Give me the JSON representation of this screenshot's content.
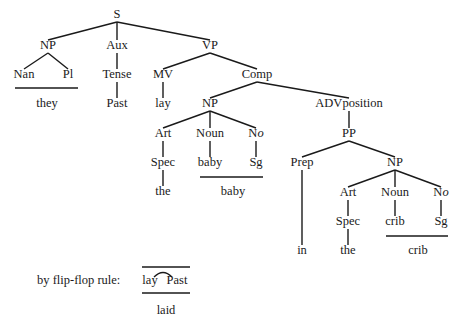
{
  "tree": {
    "nodes": [
      {
        "id": "S",
        "label": "S",
        "x": 117,
        "y": 18
      },
      {
        "id": "NP1",
        "label": "NP",
        "x": 48,
        "y": 49
      },
      {
        "id": "Aux",
        "label": "Aux",
        "x": 117,
        "y": 49
      },
      {
        "id": "VP",
        "label": "VP",
        "x": 210,
        "y": 49
      },
      {
        "id": "Nan",
        "label": "Nan",
        "x": 24,
        "y": 78
      },
      {
        "id": "Pl",
        "label": "Pl",
        "x": 68,
        "y": 78
      },
      {
        "id": "Tense",
        "label": "Tense",
        "x": 117,
        "y": 78
      },
      {
        "id": "MV",
        "label": "MV",
        "x": 163,
        "y": 78
      },
      {
        "id": "Comp",
        "label": "Comp",
        "x": 257,
        "y": 78
      },
      {
        "id": "they",
        "label": "they",
        "x": 47,
        "y": 107
      },
      {
        "id": "Past",
        "label": "Past",
        "x": 117,
        "y": 107
      },
      {
        "id": "lay",
        "label": "lay",
        "x": 163,
        "y": 107
      },
      {
        "id": "NP2",
        "label": "NP",
        "x": 210,
        "y": 107
      },
      {
        "id": "ADVposition",
        "label": "ADVposition",
        "x": 349,
        "y": 107
      },
      {
        "id": "Art1",
        "label": "Art",
        "x": 163,
        "y": 137
      },
      {
        "id": "Noun1",
        "label": "Noun",
        "x": 210,
        "y": 137
      },
      {
        "id": "No1",
        "label": "No",
        "x": 256,
        "y": 137,
        "italic_o": true
      },
      {
        "id": "PP",
        "label": "PP",
        "x": 349,
        "y": 137
      },
      {
        "id": "Spec1",
        "label": "Spec",
        "x": 163,
        "y": 166
      },
      {
        "id": "baby1",
        "label": "baby",
        "x": 210,
        "y": 166
      },
      {
        "id": "Sg1",
        "label": "Sg",
        "x": 256,
        "y": 166
      },
      {
        "id": "Prep",
        "label": "Prep",
        "x": 302,
        "y": 166
      },
      {
        "id": "NP3",
        "label": "NP",
        "x": 395,
        "y": 166
      },
      {
        "id": "the1",
        "label": "the",
        "x": 163,
        "y": 195
      },
      {
        "id": "baby2",
        "label": "baby",
        "x": 233,
        "y": 195
      },
      {
        "id": "Art2",
        "label": "Art",
        "x": 348,
        "y": 196
      },
      {
        "id": "Noun2",
        "label": "Noun",
        "x": 395,
        "y": 196
      },
      {
        "id": "No2",
        "label": "No",
        "x": 441,
        "y": 196,
        "italic_o": true
      },
      {
        "id": "Spec2",
        "label": "Spec",
        "x": 348,
        "y": 225
      },
      {
        "id": "crib1",
        "label": "crib",
        "x": 395,
        "y": 225
      },
      {
        "id": "Sg2",
        "label": "Sg",
        "x": 441,
        "y": 225
      },
      {
        "id": "in",
        "label": "in",
        "x": 302,
        "y": 254
      },
      {
        "id": "the2",
        "label": "the",
        "x": 348,
        "y": 254
      },
      {
        "id": "crib2",
        "label": "crib",
        "x": 418,
        "y": 254
      }
    ],
    "edges": [
      [
        117,
        22,
        48,
        40
      ],
      [
        117,
        22,
        117,
        40
      ],
      [
        117,
        22,
        210,
        40
      ],
      [
        48,
        53,
        24,
        69
      ],
      [
        48,
        53,
        68,
        69
      ],
      [
        117,
        53,
        117,
        69
      ],
      [
        210,
        53,
        163,
        69
      ],
      [
        210,
        53,
        257,
        69
      ],
      [
        117,
        82,
        117,
        98
      ],
      [
        163,
        82,
        163,
        98
      ],
      [
        257,
        82,
        210,
        98
      ],
      [
        257,
        82,
        349,
        98
      ],
      [
        210,
        111,
        163,
        128
      ],
      [
        210,
        111,
        210,
        128
      ],
      [
        210,
        111,
        256,
        128
      ],
      [
        349,
        111,
        349,
        128
      ],
      [
        163,
        141,
        163,
        157
      ],
      [
        210,
        141,
        210,
        157
      ],
      [
        256,
        141,
        256,
        157
      ],
      [
        349,
        141,
        302,
        157
      ],
      [
        349,
        141,
        395,
        157
      ],
      [
        163,
        170,
        163,
        186
      ],
      [
        302,
        170,
        302,
        245
      ],
      [
        395,
        170,
        348,
        187
      ],
      [
        395,
        170,
        395,
        187
      ],
      [
        395,
        170,
        441,
        187
      ],
      [
        348,
        200,
        348,
        216
      ],
      [
        395,
        200,
        395,
        216
      ],
      [
        441,
        200,
        441,
        216
      ],
      [
        348,
        229,
        348,
        245
      ]
    ],
    "underlines": [
      [
        15,
        88,
        78,
        88
      ],
      [
        200,
        177,
        263,
        177
      ],
      [
        386,
        236,
        448,
        236
      ]
    ]
  },
  "rule": {
    "label": "by flip-flop rule:",
    "label_x": 37,
    "label_y": 284,
    "word1": "lay",
    "word1_x": 150,
    "word2": "Past",
    "word2_x": 177,
    "words_y": 284,
    "result": "laid",
    "result_x": 166,
    "result_y": 314,
    "top_line": [
      142,
      267,
      190,
      267
    ],
    "bottom_line": [
      142,
      293,
      190,
      293
    ],
    "arc": "M154 277 Q163 268 172 277"
  }
}
